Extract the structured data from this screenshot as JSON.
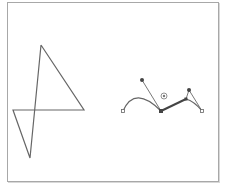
{
  "canvas": {
    "frame_color": "#a8a8a8",
    "stroke_color": "#666666",
    "handle_color": "#555555"
  },
  "shapes": {
    "polyline": {
      "name": "zigzag-path",
      "points": [
        [
          41,
          45
        ],
        [
          84,
          110
        ],
        [
          13,
          110
        ],
        [
          30,
          158
        ],
        [
          41,
          45
        ]
      ]
    },
    "bezier": {
      "name": "bezier-curve-path",
      "anchors": [
        {
          "id": "start",
          "x": 123,
          "y": 111
        },
        {
          "id": "mid",
          "x": 161,
          "y": 111
        },
        {
          "id": "upper",
          "x": 186,
          "y": 99
        },
        {
          "id": "end",
          "x": 202,
          "y": 111
        }
      ],
      "handles": [
        {
          "from": "mid",
          "x": 142,
          "y": 80
        },
        {
          "from": "upper",
          "x": 189,
          "y": 90
        }
      ],
      "center_marker": {
        "x": 164,
        "y": 96
      }
    }
  }
}
